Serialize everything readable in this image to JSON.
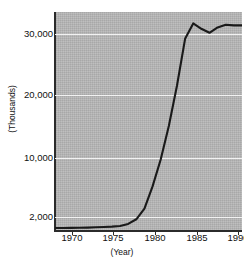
{
  "figure": {
    "background_color": "#ffffff",
    "plot_background_color": "#b7b7b7",
    "gridline_color": "#f2f2f2",
    "line_color": "#1a1a1a"
  },
  "axes": {
    "y_title": "(Thousands)",
    "x_title": "(Year)",
    "y_ticks": [
      "30,000",
      "20,000",
      "10,000",
      "2,000"
    ],
    "x_ticks": [
      "1970",
      "1975",
      "1980",
      "1985",
      "1990"
    ]
  },
  "chart_data": {
    "type": "line",
    "title": "",
    "xlabel": "(Year)",
    "ylabel": "(Thousands)",
    "xlim": [
      1969,
      1992
    ],
    "ylim": [
      1000,
      33500
    ],
    "grid": true,
    "legend": "none",
    "ytick_values": [
      30000,
      20000,
      10000,
      2000
    ],
    "ytick_labels": [
      "30,000",
      "20,000",
      "10,000",
      "2,000"
    ],
    "xtick_values": [
      1970,
      1975,
      1980,
      1985,
      1990
    ],
    "xtick_labels": [
      "1970",
      "1975",
      "1980",
      "1985",
      "1990"
    ],
    "series": [
      {
        "name": "value",
        "x": [
          1969,
          1970,
          1971,
          1972,
          1973,
          1974,
          1975,
          1976,
          1977,
          1978,
          1979,
          1980,
          1981,
          1982,
          1983,
          1984,
          1985,
          1986,
          1987,
          1988,
          1989,
          1990,
          1991,
          1992
        ],
        "values": [
          1300,
          1300,
          1320,
          1340,
          1360,
          1400,
          1450,
          1500,
          1600,
          1900,
          2600,
          4200,
          7500,
          11500,
          16500,
          22500,
          29500,
          31800,
          31000,
          30400,
          31200,
          31600,
          31500,
          31500
        ]
      }
    ]
  }
}
